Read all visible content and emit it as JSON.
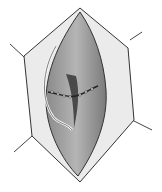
{
  "figure": {
    "colors": {
      "background": "#ffffff",
      "outline": "#333333",
      "skin_flap": "#e6e6e6",
      "deep_tissue": "#9a9a9a",
      "dark_cleft": "#4a4a4a",
      "suture": "#f2f2f2"
    }
  }
}
